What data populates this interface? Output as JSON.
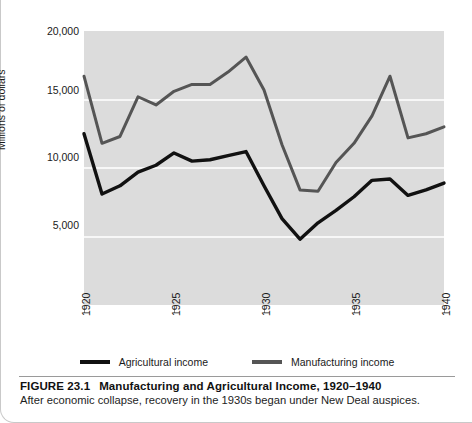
{
  "figure": {
    "number_label": "FIGURE 23.1",
    "title": "Manufacturing and Agricultural Income, 1920–1940",
    "description": "After economic collapse, recovery in the 1930s began under New Deal auspices."
  },
  "colors": {
    "plot_background": "#dcdcdc",
    "gridline": "#f7f7f7",
    "agricultural_line": "#111111",
    "manufacturing_line": "#555555",
    "page_background": "#ffffff"
  },
  "legend": {
    "position": "bottom-center",
    "items": [
      {
        "label": "Agricultural income",
        "color": "#111111"
      },
      {
        "label": "Manufacturing income",
        "color": "#555555"
      }
    ]
  },
  "axes": {
    "y_title": "Millions of dollars",
    "y_ticks": [
      "20,000",
      "15,000",
      "10,000",
      "5,000"
    ],
    "y_tick_values": [
      20000,
      15000,
      10000,
      5000
    ],
    "x_ticks": [
      "1920",
      "1925",
      "1930",
      "1935",
      "1940"
    ],
    "x_tick_values": [
      1920,
      1925,
      1930,
      1935,
      1940
    ],
    "grid": "horizontal-only"
  },
  "chart_data": {
    "type": "line",
    "title": "Manufacturing and Agricultural Income, 1920–1940",
    "xlabel": "",
    "ylabel": "Millions of dollars",
    "xlim": [
      1920,
      1940
    ],
    "ylim": [
      0,
      20000
    ],
    "grid": true,
    "legend_position": "bottom-center",
    "x": [
      1920,
      1921,
      1922,
      1923,
      1924,
      1925,
      1926,
      1927,
      1928,
      1929,
      1930,
      1931,
      1932,
      1933,
      1934,
      1935,
      1936,
      1937,
      1938,
      1939,
      1940
    ],
    "series": [
      {
        "name": "Agricultural income",
        "color": "#111111",
        "values": [
          12500,
          8100,
          8700,
          9700,
          10200,
          11100,
          10500,
          10600,
          10900,
          11200,
          8700,
          6300,
          4800,
          6000,
          6900,
          7900,
          9100,
          9200,
          8000,
          8400,
          8900
        ]
      },
      {
        "name": "Manufacturing income",
        "color": "#555555",
        "values": [
          16700,
          11800,
          12300,
          15200,
          14600,
          15600,
          16100,
          16100,
          17000,
          18100,
          15700,
          11700,
          8400,
          8300,
          10400,
          11800,
          13800,
          16700,
          12200,
          12500,
          13000
        ]
      }
    ]
  }
}
